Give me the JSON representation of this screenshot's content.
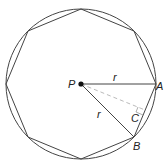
{
  "diagram": {
    "center": {
      "x": 81,
      "y": 84
    },
    "radius": 75,
    "sides": 8,
    "labels": {
      "center": "P",
      "vertex_a": "A",
      "vertex_b": "B",
      "midpoint_c": "C",
      "radius_pa": "r",
      "radius_pb": "r"
    },
    "colors": {
      "stroke": "#444444",
      "dashed": "#bbbbbb",
      "point": "#111111"
    }
  }
}
